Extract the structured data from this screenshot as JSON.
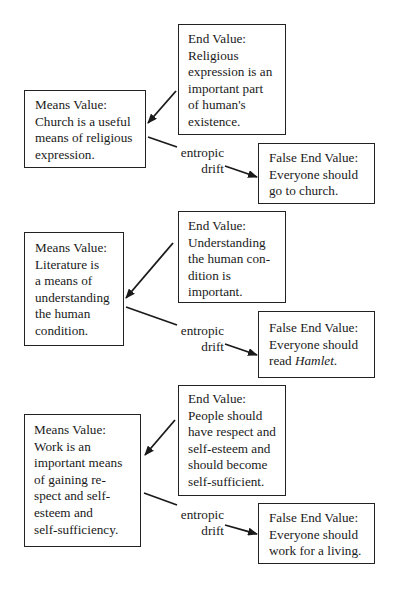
{
  "diagram": {
    "groups": [
      {
        "means": {
          "heading": "Means Value:",
          "lines": [
            "Church is a useful",
            "means of religious",
            "expression."
          ]
        },
        "end": {
          "heading": "End Value:",
          "lines": [
            "Religious",
            "expression is an",
            "important part",
            "of human's",
            "existence."
          ]
        },
        "drift_label": {
          "line1": "entropic",
          "line2": "drift"
        },
        "false_end": {
          "heading": "False End Value:",
          "lines": [
            "Everyone should",
            "go to church."
          ]
        }
      },
      {
        "means": {
          "heading": "Means Value:",
          "lines": [
            "Literature is",
            "a means of",
            "understanding",
            "the human",
            "condition."
          ]
        },
        "end": {
          "heading": "End Value:",
          "lines": [
            "Understanding",
            "the human con-",
            "dition is",
            "important."
          ]
        },
        "drift_label": {
          "line1": "entropic",
          "line2": "drift"
        },
        "false_end": {
          "heading": "False End Value:",
          "lines": [
            "Everyone should"
          ],
          "last_line_prefix": "read ",
          "last_line_italic": "Hamlet",
          "last_line_suffix": "."
        }
      },
      {
        "means": {
          "heading": "Means Value:",
          "lines": [
            "Work is an",
            "important means",
            "of gaining re-",
            "spect and self-",
            "esteem and",
            "self-sufficiency."
          ]
        },
        "end": {
          "heading": "End Value:",
          "lines": [
            "People should",
            "have respect and",
            "self-esteem and",
            "should become",
            "self-sufficient."
          ]
        },
        "drift_label": {
          "line1": "entropic",
          "line2": "drift"
        },
        "false_end": {
          "heading": "False End Value:",
          "lines": [
            "Everyone should",
            "work for a living."
          ]
        }
      }
    ]
  },
  "colors": {
    "ink": "#1a1a1a",
    "border": "#222222",
    "background": "#ffffff"
  }
}
